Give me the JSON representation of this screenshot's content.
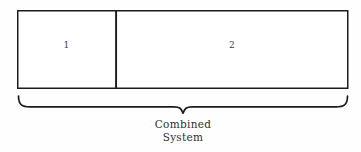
{
  "figure": {
    "background_color": "#fefefe",
    "stroke_color": "#1c1c1c",
    "text_color": "#2e2e2e"
  },
  "boxes": [
    {
      "name": "subsystem-1",
      "label": "1",
      "x": 17,
      "y": 10,
      "width": 99,
      "height": 78
    },
    {
      "name": "subsystem-2",
      "label": "2",
      "x": 116,
      "y": 10,
      "width": 232,
      "height": 78
    }
  ],
  "brace": {
    "name": "combined-system-brace",
    "left_x": 18,
    "right_x": 348,
    "center_x": 183,
    "top_y": 96,
    "stem_y": 113,
    "orientation": "down"
  },
  "caption": {
    "line1": "Combined",
    "line2": "System"
  }
}
